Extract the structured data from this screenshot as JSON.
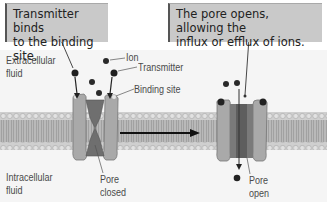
{
  "callouts": {
    "left": {
      "line1": "Transmitter binds",
      "line2": "to the binding site."
    },
    "right": {
      "line1": "The pore opens, allowing the",
      "line2": "influx or efflux of ions."
    }
  },
  "labels": {
    "extracellular_1": "Extracellular",
    "extracellular_2": "fluid",
    "intracellular_1": "Intracellular",
    "intracellular_2": "fluid",
    "ion": "Ion",
    "transmitter": "Transmitter",
    "binding_site": "Binding site",
    "pore_closed_1": "Pore",
    "pore_closed_2": "closed",
    "pore_open_1": "Pore",
    "pore_open_2": "open"
  },
  "colors": {
    "callout_bg": "#c9c9c9",
    "membrane": "#b5b5b5",
    "channel": "#a0a0a0",
    "pore": "#6f6f6f",
    "ion": "#2a2a2a"
  }
}
